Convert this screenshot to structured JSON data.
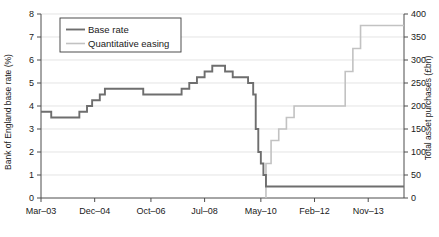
{
  "chart_data": {
    "type": "line",
    "title": "",
    "subtitle": "",
    "xlabel": "",
    "ylabel": "Bank of England base rate (%)",
    "y2label": "Total asset purchases (£bn)",
    "grid": true,
    "legend_position": "top-left",
    "xlim": [
      0,
      142
    ],
    "ylim": [
      0,
      8
    ],
    "y2lim": [
      0,
      400
    ],
    "x_tick_labels": [
      "Mar–03",
      "Dec–04",
      "Oct–06",
      "Jul–08",
      "May–10",
      "Feb–12",
      "Nov–13"
    ],
    "x_tick_months": [
      0,
      21,
      43,
      64,
      86,
      107,
      128
    ],
    "y_tick_labels": [
      "0",
      "1",
      "2",
      "3",
      "4",
      "5",
      "6",
      "7",
      "8"
    ],
    "y_tick_values": [
      0,
      1,
      2,
      3,
      4,
      5,
      6,
      7,
      8
    ],
    "y2_tick_labels": [
      "0",
      "50",
      "100",
      "150",
      "200",
      "250",
      "300",
      "350",
      "400"
    ],
    "y2_tick_values": [
      0,
      50,
      100,
      150,
      200,
      250,
      300,
      350,
      400
    ],
    "series": [
      {
        "name": "Base rate",
        "axis": "left",
        "color": "#6e6e6e",
        "units": "%",
        "step": "post",
        "points": [
          {
            "x": 0,
            "y": 3.75
          },
          {
            "x": 4,
            "y": 3.75
          },
          {
            "x": 4,
            "y": 3.5
          },
          {
            "x": 15,
            "y": 3.5
          },
          {
            "x": 15,
            "y": 3.75
          },
          {
            "x": 18,
            "y": 3.75
          },
          {
            "x": 18,
            "y": 4.0
          },
          {
            "x": 20,
            "y": 4.0
          },
          {
            "x": 20,
            "y": 4.25
          },
          {
            "x": 23,
            "y": 4.25
          },
          {
            "x": 23,
            "y": 4.5
          },
          {
            "x": 25,
            "y": 4.5
          },
          {
            "x": 25,
            "y": 4.75
          },
          {
            "x": 40,
            "y": 4.75
          },
          {
            "x": 40,
            "y": 4.5
          },
          {
            "x": 55,
            "y": 4.5
          },
          {
            "x": 55,
            "y": 4.75
          },
          {
            "x": 58,
            "y": 4.75
          },
          {
            "x": 58,
            "y": 5.0
          },
          {
            "x": 61,
            "y": 5.0
          },
          {
            "x": 61,
            "y": 5.25
          },
          {
            "x": 64,
            "y": 5.25
          },
          {
            "x": 64,
            "y": 5.5
          },
          {
            "x": 67,
            "y": 5.5
          },
          {
            "x": 67,
            "y": 5.75
          },
          {
            "x": 72,
            "y": 5.75
          },
          {
            "x": 72,
            "y": 5.5
          },
          {
            "x": 75,
            "y": 5.5
          },
          {
            "x": 75,
            "y": 5.25
          },
          {
            "x": 81,
            "y": 5.25
          },
          {
            "x": 81,
            "y": 5.0
          },
          {
            "x": 83,
            "y": 5.0
          },
          {
            "x": 83,
            "y": 4.5
          },
          {
            "x": 84,
            "y": 4.5
          },
          {
            "x": 84,
            "y": 3.0
          },
          {
            "x": 85,
            "y": 3.0
          },
          {
            "x": 85,
            "y": 2.0
          },
          {
            "x": 86,
            "y": 2.0
          },
          {
            "x": 86,
            "y": 1.5
          },
          {
            "x": 87,
            "y": 1.5
          },
          {
            "x": 87,
            "y": 1.0
          },
          {
            "x": 88,
            "y": 1.0
          },
          {
            "x": 88,
            "y": 0.5
          },
          {
            "x": 142,
            "y": 0.5
          }
        ]
      },
      {
        "name": "Quantitative easing",
        "axis": "right",
        "color": "#c2c2c2",
        "units": "£bn",
        "step": "post",
        "points": [
          {
            "x": 88,
            "y": 0
          },
          {
            "x": 88,
            "y": 75
          },
          {
            "x": 90,
            "y": 75
          },
          {
            "x": 90,
            "y": 125
          },
          {
            "x": 93,
            "y": 125
          },
          {
            "x": 93,
            "y": 150
          },
          {
            "x": 96,
            "y": 150
          },
          {
            "x": 96,
            "y": 175
          },
          {
            "x": 99,
            "y": 175
          },
          {
            "x": 99,
            "y": 200
          },
          {
            "x": 119,
            "y": 200
          },
          {
            "x": 119,
            "y": 275
          },
          {
            "x": 122,
            "y": 275
          },
          {
            "x": 122,
            "y": 325
          },
          {
            "x": 125,
            "y": 325
          },
          {
            "x": 125,
            "y": 375
          },
          {
            "x": 142,
            "y": 375
          }
        ]
      }
    ]
  },
  "legend": {
    "items": [
      {
        "label": "Base rate",
        "color": "#6e6e6e"
      },
      {
        "label": "Quantitative easing",
        "color": "#c2c2c2"
      }
    ]
  },
  "axes": {
    "left_title": "Bank of England base rate (%)",
    "right_title": "Total asset purchases (£bn)"
  }
}
